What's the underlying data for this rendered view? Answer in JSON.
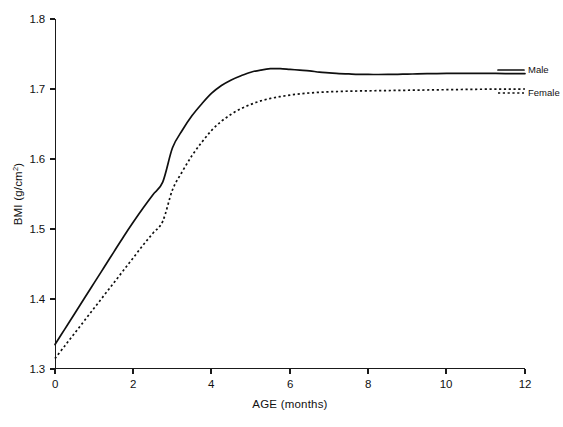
{
  "chart_data": {
    "type": "line",
    "title": "",
    "xlabel": "AGE (months)",
    "ylabel": "BMI (g/cm²)",
    "ylabel_main": "BMI (g/cm",
    "ylabel_sup": "2",
    "ylabel_tail": ")",
    "xlim": [
      0,
      12
    ],
    "ylim": [
      1.3,
      1.8
    ],
    "grid": false,
    "legend_position": "right-inside-top",
    "xticks": [
      0,
      2,
      4,
      6,
      8,
      10,
      12
    ],
    "xtick_labels": [
      "0",
      "2",
      "4",
      "6",
      "8",
      "10",
      "12"
    ],
    "yticks": [
      1.3,
      1.4,
      1.5,
      1.6,
      1.7,
      1.8
    ],
    "ytick_labels": [
      "1.3",
      "1.4",
      "1.5",
      "1.6",
      "1.7",
      "1.8"
    ],
    "x": [
      0,
      0.25,
      0.5,
      0.75,
      1,
      1.25,
      1.5,
      1.75,
      2,
      2.25,
      2.5,
      2.75,
      3,
      3.25,
      3.5,
      3.75,
      4,
      4.25,
      4.5,
      4.75,
      5,
      5.25,
      5.5,
      5.75,
      6,
      6.25,
      6.5,
      6.75,
      7,
      7.25,
      7.5,
      7.75,
      8,
      8.25,
      8.5,
      8.75,
      9,
      9.25,
      9.5,
      9.75,
      10,
      10.25,
      10.5,
      10.75,
      11,
      11.25,
      11.5,
      11.75,
      12
    ],
    "series": [
      {
        "name": "Male",
        "style": "solid",
        "color": "#0f0f0f",
        "values": [
          1.335,
          1.357,
          1.379,
          1.401,
          1.423,
          1.445,
          1.467,
          1.489,
          1.51,
          1.53,
          1.549,
          1.567,
          1.616,
          1.641,
          1.662,
          1.679,
          1.694,
          1.705,
          1.713,
          1.719,
          1.724,
          1.727,
          1.729,
          1.729,
          1.728,
          1.727,
          1.726,
          1.724,
          1.723,
          1.722,
          1.7215,
          1.721,
          1.7208,
          1.7207,
          1.7208,
          1.721,
          1.7213,
          1.7216,
          1.7219,
          1.7221,
          1.7223,
          1.7224,
          1.7224,
          1.7224,
          1.7223,
          1.7222,
          1.7221,
          1.722,
          1.722
        ]
      },
      {
        "name": "Female",
        "style": "dashed",
        "color": "#0f0f0f",
        "values": [
          1.315,
          1.333,
          1.351,
          1.369,
          1.387,
          1.405,
          1.423,
          1.441,
          1.459,
          1.477,
          1.494,
          1.511,
          1.556,
          1.582,
          1.605,
          1.624,
          1.641,
          1.654,
          1.664,
          1.672,
          1.678,
          1.683,
          1.6865,
          1.6892,
          1.6913,
          1.693,
          1.6943,
          1.6953,
          1.696,
          1.6965,
          1.6969,
          1.6972,
          1.6974,
          1.6976,
          1.6978,
          1.698,
          1.6982,
          1.6984,
          1.6986,
          1.6988,
          1.699,
          1.6992,
          1.6994,
          1.6996,
          1.6997,
          1.6998,
          1.6999,
          1.6999,
          1.7
        ]
      }
    ],
    "legend": [
      {
        "label": "Male",
        "style": "solid"
      },
      {
        "label": "Female",
        "style": "dashed"
      }
    ]
  }
}
